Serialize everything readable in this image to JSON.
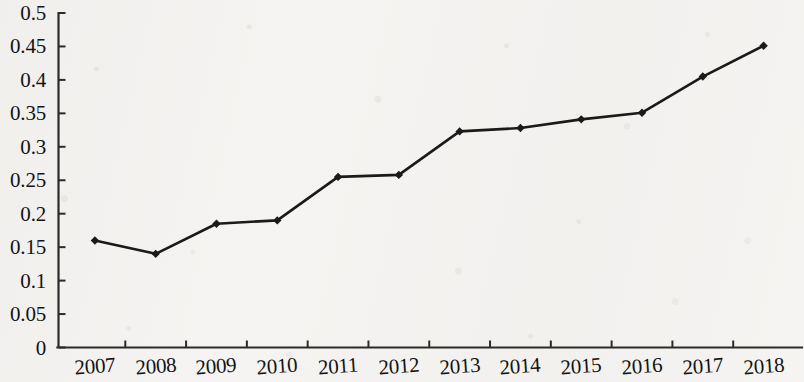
{
  "chart_data": {
    "type": "line",
    "title": "",
    "subtitle": "",
    "xlabel": "",
    "ylabel": "",
    "categories": [
      "2007",
      "2008",
      "2009",
      "2010",
      "2011",
      "2012",
      "2013",
      "2014",
      "2015",
      "2016",
      "2017",
      "2018"
    ],
    "values": [
      0.16,
      0.14,
      0.185,
      0.19,
      0.255,
      0.258,
      0.323,
      0.328,
      0.341,
      0.351,
      0.405,
      0.451
    ],
    "series": [
      {
        "name": "",
        "values": [
          0.16,
          0.14,
          0.185,
          0.19,
          0.255,
          0.258,
          0.323,
          0.328,
          0.341,
          0.351,
          0.405,
          0.451
        ]
      }
    ],
    "ylim": [
      0,
      0.5
    ],
    "ytick_labels": [
      "0",
      "0.05",
      "0.1",
      "0.15",
      "0.2",
      "0.25",
      "0.3",
      "0.35",
      "0.4",
      "0.45",
      "0.5"
    ],
    "ytick_values": [
      0,
      0.05,
      0.1,
      0.15,
      0.2,
      0.25,
      0.3,
      0.35,
      0.4,
      0.45,
      0.5
    ],
    "grid": false,
    "legend": false,
    "legend_position": "none",
    "line_color": "#1a1a1a",
    "marker": "diamond",
    "marker_color": "#1a1a1a",
    "background_color": "#f5f4f2",
    "axis_color": "#2b2b2b",
    "annotations": []
  }
}
